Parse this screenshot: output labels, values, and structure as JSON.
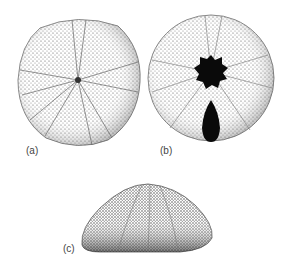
{
  "figure": {
    "panels": [
      {
        "id": "a",
        "label": "(a)",
        "view": "aboral"
      },
      {
        "id": "b",
        "label": "(b)",
        "view": "oral"
      },
      {
        "id": "c",
        "label": "(c)",
        "view": "lateral"
      }
    ]
  },
  "colors": {
    "stipple": "#555555",
    "dark": "#0a0a0a",
    "background": "#ffffff"
  }
}
